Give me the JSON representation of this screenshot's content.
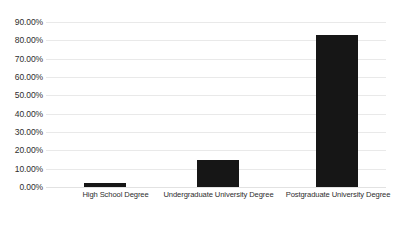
{
  "chart_data": {
    "type": "bar",
    "title": "",
    "xlabel": "",
    "ylabel": "",
    "categories": [
      "High School Degree",
      "Undergraduate University Degree",
      "Postgraduate University Degree"
    ],
    "values": [
      2.0,
      15.0,
      83.0
    ],
    "value_labels": [
      "2.00%",
      "15.00%",
      "83.00%"
    ],
    "ylim": [
      0,
      90
    ],
    "ytick_values": [
      0,
      10,
      20,
      30,
      40,
      50,
      60,
      70,
      80,
      90
    ],
    "ytick_labels": [
      "0.00%",
      "10.00%",
      "20.00%",
      "30.00%",
      "40.00%",
      "50.00%",
      "60.00%",
      "70.00%",
      "80.00%",
      "90.00%"
    ],
    "grid": true,
    "legend": false,
    "legend_position": "none",
    "series": [
      {
        "name": "",
        "values": [
          2.0,
          15.0,
          83.0
        ]
      }
    ],
    "colors": {
      "bar": "#161616",
      "gridline": "#e9e9e9",
      "background": "#ffffff",
      "text": "#2e2e2e"
    }
  }
}
